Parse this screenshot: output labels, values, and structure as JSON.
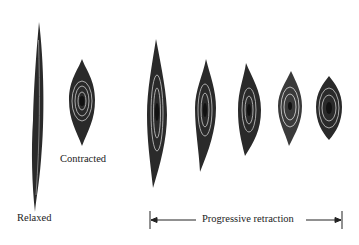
{
  "diagram": {
    "labels": {
      "relaxed": "Relaxed",
      "contracted": "Contracted",
      "progressive": "Progressive retraction"
    },
    "cells": [
      {
        "id": "relaxed",
        "cx": 38,
        "top": 22,
        "bottom": 212,
        "width": 10
      },
      {
        "id": "contracted",
        "cx": 82,
        "top": 59,
        "bottom": 146,
        "width": 26
      },
      {
        "id": "retract-1",
        "cx": 157,
        "top": 39,
        "bottom": 188,
        "width": 20
      },
      {
        "id": "retract-2",
        "cx": 205,
        "top": 59,
        "bottom": 172,
        "width": 22
      },
      {
        "id": "retract-3",
        "cx": 249,
        "top": 63,
        "bottom": 156,
        "width": 22
      },
      {
        "id": "retract-4",
        "cx": 290,
        "top": 71,
        "bottom": 146,
        "width": 24
      },
      {
        "id": "retract-5",
        "cx": 329,
        "top": 76,
        "bottom": 140,
        "width": 26
      }
    ],
    "colors": {
      "ink": "#1a1a1a",
      "background": "#ffffff"
    }
  }
}
